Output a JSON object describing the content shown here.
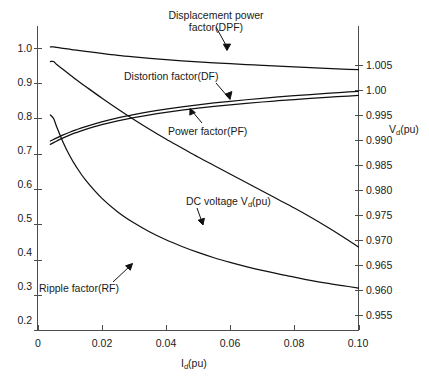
{
  "chart_data": {
    "type": "line",
    "title": "",
    "xlabel": "Id(pu)",
    "ylabel": "",
    "y2label": "Vd(pu)",
    "xlim": [
      0,
      0.1
    ],
    "ylim": [
      0.2,
      1.0
    ],
    "y2lim": [
      0.955,
      1.005
    ],
    "grid": false,
    "legend_position": "inline-annotations",
    "xticks": [
      "0",
      "0.02",
      "0.04",
      "0.06",
      "0.08",
      "0.10"
    ],
    "xtick_values": [
      0,
      0.02,
      0.04,
      0.06,
      0.08,
      0.1
    ],
    "yticks": [
      "0.2",
      "0.3",
      "0.4",
      "0.5",
      "0.6",
      "0.7",
      "0.8",
      "0.9",
      "1.0"
    ],
    "ytick_values": [
      0.2,
      0.3,
      0.4,
      0.5,
      0.6,
      0.7,
      0.8,
      0.9,
      1.0
    ],
    "y2ticks": [
      "0.955",
      "0.960",
      "0.965",
      "0.970",
      "0.975",
      "0.980",
      "0.985",
      "0.990",
      "0.995",
      "1.00",
      "1.005"
    ],
    "y2tick_values": [
      0.955,
      0.96,
      0.965,
      0.97,
      0.975,
      0.98,
      0.985,
      0.99,
      0.995,
      1.0,
      1.005
    ],
    "x": [
      0.004,
      0.005,
      0.006,
      0.008,
      0.01,
      0.012,
      0.015,
      0.02,
      0.025,
      0.03,
      0.035,
      0.04,
      0.045,
      0.05,
      0.055,
      0.06,
      0.065,
      0.07,
      0.075,
      0.08,
      0.085,
      0.09,
      0.095,
      0.1
    ],
    "series": [
      {
        "name": "Displacement power factor(DPF)",
        "axis": "left",
        "values": [
          1.003,
          1.003,
          1.0015,
          0.999,
          0.9965,
          0.994,
          0.9905,
          0.9845,
          0.979,
          0.9745,
          0.9705,
          0.967,
          0.9638,
          0.9608,
          0.958,
          0.9554,
          0.953,
          0.9507,
          0.9485,
          0.9464,
          0.9443,
          0.9423,
          0.9404,
          0.9385
        ]
      },
      {
        "name": "Distortion factor(DF)",
        "axis": "left",
        "values": [
          0.736,
          0.7405,
          0.745,
          0.7535,
          0.761,
          0.7678,
          0.777,
          0.7905,
          0.8018,
          0.8112,
          0.8194,
          0.8266,
          0.833,
          0.8388,
          0.844,
          0.8488,
          0.8532,
          0.8573,
          0.8611,
          0.8647,
          0.868,
          0.8712,
          0.8742,
          0.877
        ]
      },
      {
        "name": "Power factor(PF)",
        "axis": "left",
        "values": [
          0.7265,
          0.7315,
          0.7362,
          0.745,
          0.7528,
          0.7598,
          0.769,
          0.7824,
          0.7934,
          0.8026,
          0.8105,
          0.8174,
          0.8236,
          0.8291,
          0.8341,
          0.8387,
          0.8429,
          0.8468,
          0.8504,
          0.8538,
          0.857,
          0.86,
          0.8628,
          0.8655
        ]
      },
      {
        "name": "Ripple factor(RF)",
        "axis": "left",
        "values": [
          0.81,
          0.8,
          0.776,
          0.732,
          0.695,
          0.664,
          0.625,
          0.574,
          0.535,
          0.504,
          0.478,
          0.456,
          0.437,
          0.42,
          0.405,
          0.392,
          0.38,
          0.369,
          0.359,
          0.35,
          0.341,
          0.333,
          0.326,
          0.319
        ]
      },
      {
        "name": "DC voltage Vd(pu)",
        "axis": "right",
        "values": [
          1.0057,
          1.0057,
          1.0051,
          1.0041,
          1.0031,
          1.0021,
          1.0007,
          0.9984,
          0.9962,
          0.9941,
          0.9921,
          0.9902,
          0.9884,
          0.9866,
          0.9849,
          0.9832,
          0.9815,
          0.9798,
          0.9781,
          0.9764,
          0.9746,
          0.9727,
          0.9707,
          0.9686
        ]
      }
    ],
    "annotations": [
      {
        "name": "dpf-annotation",
        "text_line1": "Displacement power",
        "text_line2": "factor(DPF)"
      },
      {
        "name": "df-annotation",
        "text": "Distortion factor(DF)"
      },
      {
        "name": "pf-annotation",
        "text": "Power factor(PF)"
      },
      {
        "name": "dc-voltage-annotation",
        "text_prefix": "DC voltage V",
        "text_sub": "d",
        "text_suffix": "(pu)"
      },
      {
        "name": "rf-annotation",
        "text": "Ripple factor(RF)"
      }
    ]
  },
  "axes": {
    "x_title_prefix": "I",
    "x_title_sub": "d",
    "x_title_suffix": "(pu)",
    "y2_title_prefix": "V",
    "y2_title_sub": "d",
    "y2_title_suffix": "(pu)"
  },
  "colors": {
    "axis": "#4d4d4d",
    "curve": "#111111",
    "text": "#1a1a1a",
    "background": "#ffffff"
  },
  "labels": {
    "x_ticks": [
      "0",
      "0.02",
      "0.04",
      "0.06",
      "0.08",
      "0.10"
    ],
    "y_ticks": [
      "1.0",
      "0.9",
      "0.8",
      "0.7",
      "0.6",
      "0.5",
      "0.4",
      "0.3",
      "0.2"
    ],
    "y2_ticks": [
      "1.005",
      "1.00",
      "0.995",
      "0.990",
      "0.985",
      "0.980",
      "0.975",
      "0.970",
      "0.965",
      "0.960",
      "0.955"
    ],
    "annot_dpf_1": "Displacement power",
    "annot_dpf_2": "factor(DPF)",
    "annot_df": "Distortion factor(DF)",
    "annot_pf": "Power factor(PF)",
    "annot_rf": "Ripple factor(RF)",
    "annot_dc_prefix": "DC voltage V",
    "annot_dc_sub": "d",
    "annot_dc_suffix": "(pu)"
  }
}
